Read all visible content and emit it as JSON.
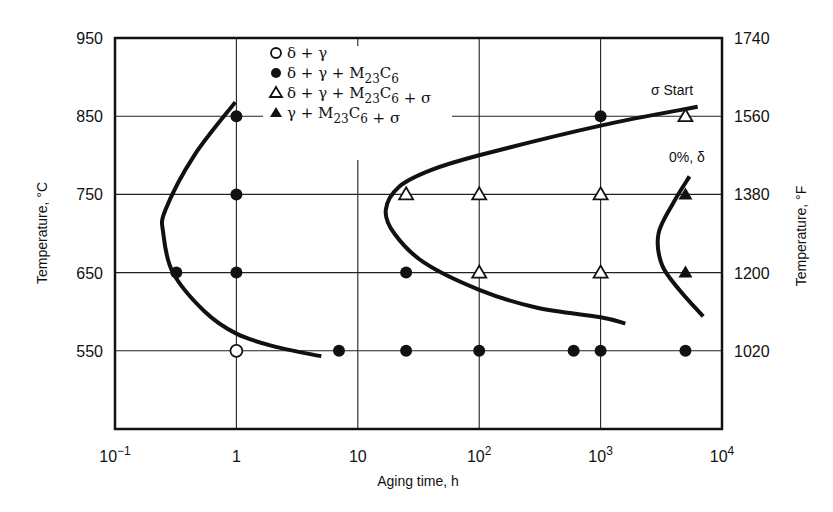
{
  "chart_data": {
    "type": "scatter",
    "title": "",
    "xlabel": "Aging time, h",
    "ylabel_left": "Temperature, °C",
    "ylabel_right": "Temperature, °F",
    "xscale": "log",
    "xlim": [
      0.1,
      10000
    ],
    "ylim": [
      450,
      950
    ],
    "x_ticks": [
      {
        "value": 0.1,
        "base": "10",
        "exp": "−1"
      },
      {
        "value": 1,
        "base": "1",
        "exp": ""
      },
      {
        "value": 10,
        "base": "10",
        "exp": ""
      },
      {
        "value": 100,
        "base": "10",
        "exp": "2"
      },
      {
        "value": 1000,
        "base": "10",
        "exp": "3"
      },
      {
        "value": 10000,
        "base": "10",
        "exp": "4"
      }
    ],
    "y_ticks_left": [
      "950",
      "850",
      "750",
      "650",
      "550"
    ],
    "y_tick_values_left": [
      950,
      850,
      750,
      650,
      550
    ],
    "y_ticks_right": [
      "1740",
      "1560",
      "1380",
      "1200",
      "1020"
    ],
    "grid": true,
    "legend_position": "upper-left-inside",
    "legend": [
      {
        "marker": "open-circle",
        "label": "δ + γ"
      },
      {
        "marker": "filled-circle",
        "label": "δ + γ + M23C6"
      },
      {
        "marker": "open-triangle",
        "label": "δ + γ + M23C6 + σ"
      },
      {
        "marker": "filled-triangle",
        "label": "γ + M23C6 + σ"
      }
    ],
    "series": [
      {
        "name": "δ + γ",
        "marker": "open-circle",
        "points": [
          [
            1,
            550
          ]
        ]
      },
      {
        "name": "δ + γ + M23C6",
        "marker": "filled-circle",
        "points": [
          [
            1,
            850
          ],
          [
            1,
            750
          ],
          [
            0.32,
            650
          ],
          [
            1,
            650
          ],
          [
            25,
            650
          ],
          [
            7,
            550
          ],
          [
            25,
            550
          ],
          [
            100,
            550
          ],
          [
            600,
            550
          ],
          [
            1000,
            550
          ],
          [
            5000,
            550
          ],
          [
            1000,
            850
          ]
        ]
      },
      {
        "name": "δ + γ + M23C6 + σ",
        "marker": "open-triangle",
        "points": [
          [
            25,
            750
          ],
          [
            100,
            750
          ],
          [
            1000,
            750
          ],
          [
            100,
            650
          ],
          [
            1000,
            650
          ],
          [
            5000,
            850
          ]
        ]
      },
      {
        "name": "γ + M23C6 + σ",
        "marker": "filled-triangle",
        "points": [
          [
            5000,
            750
          ],
          [
            5000,
            650
          ]
        ]
      }
    ],
    "curves": [
      {
        "name": "M23C6 start (left C-curve)",
        "points": [
          [
            0.98,
            868
          ],
          [
            0.45,
            800
          ],
          [
            0.26,
            730
          ],
          [
            0.25,
            700
          ],
          [
            0.3,
            650
          ],
          [
            0.55,
            600
          ],
          [
            1,
            572
          ],
          [
            2,
            556
          ],
          [
            5,
            543
          ]
        ]
      },
      {
        "name": "σ Start",
        "points": [
          [
            6300,
            862
          ],
          [
            1000,
            838
          ],
          [
            100,
            800
          ],
          [
            40,
            781
          ],
          [
            22,
            760
          ],
          [
            17,
            730
          ],
          [
            20,
            700
          ],
          [
            35,
            663
          ],
          [
            100,
            628
          ],
          [
            300,
            605
          ],
          [
            1000,
            593
          ],
          [
            1600,
            585
          ]
        ]
      },
      {
        "name": "0%, δ",
        "points": [
          [
            5400,
            773
          ],
          [
            4000,
            740
          ],
          [
            3000,
            700
          ],
          [
            3200,
            660
          ],
          [
            4500,
            627
          ],
          [
            7000,
            594
          ]
        ]
      }
    ],
    "annotations": [
      {
        "text": "σ Start",
        "x": 6000,
        "y": 890
      },
      {
        "text": "0%, δ",
        "x": 4500,
        "y": 790
      }
    ]
  },
  "labels": {
    "x_axis_title": "Aging time, h",
    "y_axis_left_title": "Temperature, °C",
    "y_axis_right_title": "Temperature, °F",
    "sigma_start": "σ Start",
    "zero_delta": "0%, δ"
  }
}
